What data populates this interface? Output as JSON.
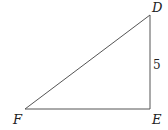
{
  "diagram": {
    "type": "right-triangle",
    "vertices": {
      "D": {
        "label": "D",
        "x": 150,
        "y": 15
      },
      "E": {
        "label": "E",
        "x": 150,
        "y": 109
      },
      "F": {
        "label": "F",
        "x": 25,
        "y": 109
      }
    },
    "side_labels": {
      "DE": "5"
    },
    "stroke_color": "#555555"
  }
}
